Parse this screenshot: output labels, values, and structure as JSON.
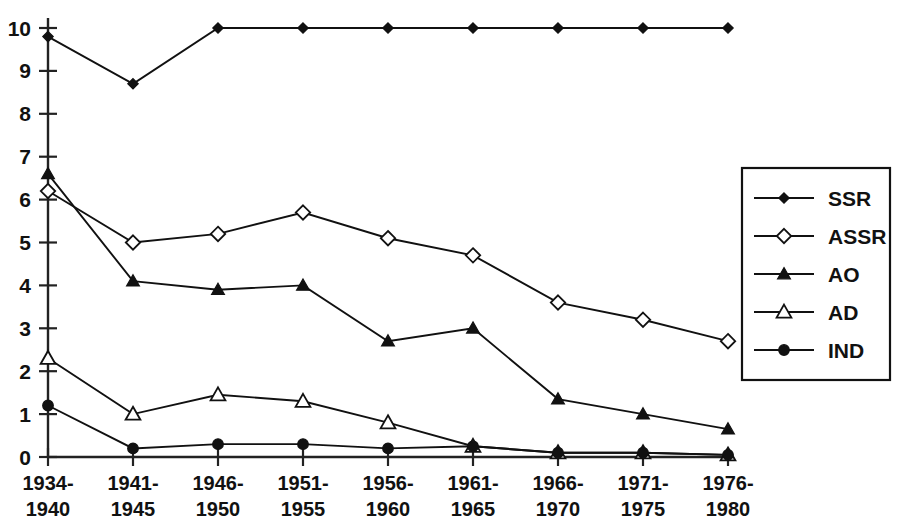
{
  "chart_data": {
    "type": "line",
    "title": "",
    "subtitle": "",
    "xlabel": "",
    "ylabel": "",
    "categories": [
      "1934-\n1940",
      "1941-\n1945",
      "1946-\n1950",
      "1951-\n1955",
      "1956-\n1960",
      "1961-\n1965",
      "1966-\n1970",
      "1971-\n1975",
      "1976-\n1980"
    ],
    "category_lines": [
      [
        "1934-",
        "1940"
      ],
      [
        "1941-",
        "1945"
      ],
      [
        "1946-",
        "1950"
      ],
      [
        "1951-",
        "1955"
      ],
      [
        "1956-",
        "1960"
      ],
      [
        "1961-",
        "1965"
      ],
      [
        "1966-",
        "1970"
      ],
      [
        "1971-",
        "1975"
      ],
      [
        "1976-",
        "1980"
      ]
    ],
    "series": [
      {
        "name": "SSR",
        "marker": "filled-diamond",
        "values": [
          9.8,
          8.7,
          10.0,
          10.0,
          10.0,
          10.0,
          10.0,
          10.0,
          10.0
        ]
      },
      {
        "name": "ASSR",
        "marker": "open-diamond",
        "values": [
          6.2,
          5.0,
          5.2,
          5.7,
          5.1,
          4.7,
          3.6,
          3.2,
          2.7
        ]
      },
      {
        "name": "AO",
        "marker": "filled-triangle",
        "values": [
          6.6,
          4.1,
          3.9,
          4.0,
          2.7,
          3.0,
          1.35,
          1.0,
          0.65
        ]
      },
      {
        "name": "AD",
        "marker": "open-triangle",
        "values": [
          2.3,
          1.0,
          1.45,
          1.3,
          0.8,
          0.25,
          0.1,
          0.1,
          0.05
        ]
      },
      {
        "name": "IND",
        "marker": "filled-circle",
        "values": [
          1.2,
          0.2,
          0.3,
          0.3,
          0.2,
          0.25,
          0.1,
          0.1,
          0.05
        ]
      }
    ],
    "ylim": [
      0,
      10
    ],
    "yticks": [
      0,
      1,
      2,
      3,
      4,
      5,
      6,
      7,
      8,
      9,
      10
    ],
    "ytick_labels": [
      "0",
      "1",
      "2",
      "3",
      "4",
      "5",
      "6",
      "7",
      "8",
      "9",
      "10"
    ],
    "grid": false,
    "legend_position": "right",
    "line_color": "#111111"
  },
  "legend": {
    "entries": [
      {
        "label": "SSR"
      },
      {
        "label": "ASSR"
      },
      {
        "label": "AO"
      },
      {
        "label": "AD"
      },
      {
        "label": "IND"
      }
    ]
  }
}
